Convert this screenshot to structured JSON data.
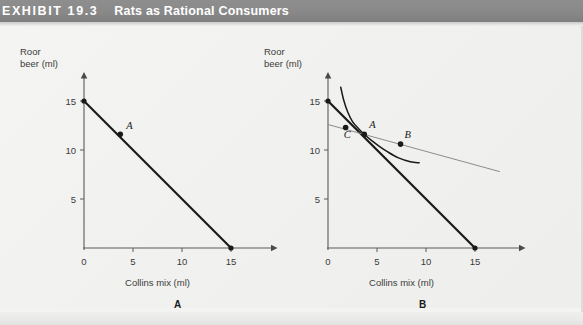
{
  "exhibit": {
    "label": "EXHIBIT  19.3",
    "title": "Rats as Rational Consumers",
    "banner_color": "#8a8a8a",
    "banner_text_color": "#ffffff",
    "background_color": "#f1f1ef"
  },
  "panels": [
    {
      "caption": "A"
    },
    {
      "caption": "B"
    }
  ],
  "chart_data": [
    {
      "type": "line",
      "panel": "A",
      "title": "",
      "xlabel": "Collins mix (ml)",
      "ylabel": "Roor beer (ml)",
      "xlim": [
        0,
        19
      ],
      "ylim": [
        0,
        17
      ],
      "xticks": [
        0,
        5,
        10,
        15
      ],
      "yticks": [
        5,
        10,
        15
      ],
      "grid": false,
      "legend": "none",
      "series": [
        {
          "name": "budget-line",
          "style": "solid-thick",
          "color": "#1a1a1a",
          "x": [
            0,
            15
          ],
          "y": [
            15,
            0
          ]
        }
      ],
      "points": [
        {
          "label": "A",
          "x": 3.7,
          "y": 11.6,
          "label_dx": 6,
          "label_dy": -5
        }
      ],
      "endpoints": [
        {
          "x": 0,
          "y": 15
        },
        {
          "x": 15,
          "y": 0
        }
      ]
    },
    {
      "type": "line",
      "panel": "B",
      "title": "",
      "xlabel": "Collins mix (ml)",
      "ylabel": "Roor beer (ml)",
      "xlim": [
        0,
        19
      ],
      "ylim": [
        0,
        17
      ],
      "xticks": [
        0,
        5,
        10,
        15
      ],
      "yticks": [
        5,
        10,
        15
      ],
      "grid": false,
      "legend": "none",
      "series": [
        {
          "name": "budget-line",
          "style": "solid-thick",
          "color": "#1a1a1a",
          "x": [
            0,
            15
          ],
          "y": [
            15,
            0
          ]
        },
        {
          "name": "indifference-curve",
          "style": "solid-thin",
          "color": "#1a1a1a",
          "x": [
            1.3,
            1.6,
            2.0,
            2.5,
            3.1,
            3.7,
            4.4,
            5.2,
            6.1,
            7.2,
            8.4,
            9.3
          ],
          "y": [
            16.4,
            15.1,
            13.9,
            12.9,
            12.2,
            11.6,
            11.0,
            10.4,
            9.8,
            9.2,
            8.8,
            8.7
          ]
        },
        {
          "name": "flatter-budget-line",
          "style": "solid-gray",
          "color": "#8c8c8c",
          "x": [
            0,
            17.5
          ],
          "y": [
            12.6,
            7.8
          ]
        }
      ],
      "points": [
        {
          "label": "A",
          "x": 3.7,
          "y": 11.6,
          "label_dx": 5,
          "label_dy": -6
        },
        {
          "label": "B",
          "x": 7.4,
          "y": 10.6,
          "label_dx": 4,
          "label_dy": -6
        },
        {
          "label": "C",
          "x": 1.8,
          "y": 12.3,
          "label_dx": -2,
          "label_dy": 11
        }
      ],
      "endpoints": [
        {
          "x": 0,
          "y": 15
        },
        {
          "x": 15,
          "y": 0
        }
      ]
    }
  ]
}
